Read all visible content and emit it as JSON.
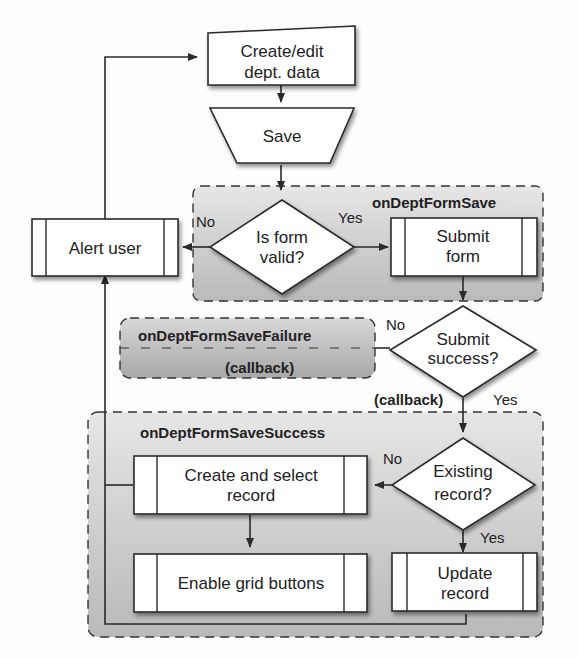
{
  "diagram": {
    "type": "flowchart",
    "colors": {
      "background": "#fdfdfd",
      "node_fill": "#ffffff",
      "stroke": "#2a2a2a",
      "group_fill": "#c4c4c4",
      "shadow": "#9a9a9a"
    },
    "nodes": {
      "create_edit": {
        "line1": "Create/edit",
        "line2": "dept. data",
        "shape": "manual-input"
      },
      "save": {
        "label": "Save",
        "shape": "manual-operation"
      },
      "is_valid": {
        "line1": "Is form",
        "line2": "valid?",
        "shape": "decision"
      },
      "alert_user": {
        "label": "Alert user",
        "shape": "predefined-process"
      },
      "submit_form": {
        "line1": "Submit",
        "line2": "form",
        "shape": "predefined-process"
      },
      "submit_success": {
        "line1": "Submit",
        "line2": "success?",
        "shape": "decision"
      },
      "existing_record": {
        "line1": "Existing",
        "line2": "record?",
        "shape": "decision"
      },
      "create_select": {
        "line1": "Create and select",
        "line2": "record",
        "shape": "predefined-process"
      },
      "enable_grid": {
        "label": "Enable grid buttons",
        "shape": "predefined-process"
      },
      "update_record": {
        "line1": "Update",
        "line2": "record",
        "shape": "predefined-process"
      }
    },
    "groups": {
      "save_handler": {
        "title": "onDeptFormSave"
      },
      "failure_handler": {
        "title": "onDeptFormSaveFailure",
        "subtitle": "(callback)"
      },
      "success_handler": {
        "title": "onDeptFormSaveSuccess"
      }
    },
    "edge_labels": {
      "valid_no": "No",
      "valid_yes": "Yes",
      "success_no": "No",
      "success_yes": "Yes",
      "success_callback": "(callback)",
      "existing_no": "No",
      "existing_yes": "Yes"
    },
    "edges": [
      {
        "from": "create_edit",
        "to": "save"
      },
      {
        "from": "save",
        "to": "is_valid"
      },
      {
        "from": "is_valid",
        "to": "alert_user",
        "label": "No"
      },
      {
        "from": "is_valid",
        "to": "submit_form",
        "label": "Yes"
      },
      {
        "from": "alert_user",
        "to": "create_edit"
      },
      {
        "from": "submit_form",
        "to": "submit_success"
      },
      {
        "from": "submit_success",
        "to": "failure_handler",
        "label": "No"
      },
      {
        "from": "submit_success",
        "to": "existing_record",
        "label": "Yes (callback)"
      },
      {
        "from": "existing_record",
        "to": "create_select",
        "label": "No"
      },
      {
        "from": "existing_record",
        "to": "update_record",
        "label": "Yes"
      },
      {
        "from": "create_select",
        "to": "enable_grid"
      },
      {
        "from": "create_select",
        "to": "alert_user"
      },
      {
        "from": "update_record",
        "to": "alert_user"
      }
    ]
  }
}
